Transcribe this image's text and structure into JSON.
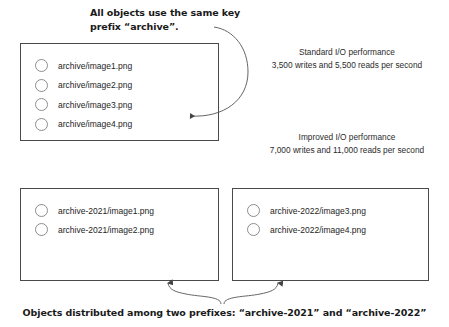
{
  "callouts": {
    "top": "All objects use the same key prefix “archive”.",
    "bottom": "Objects distributed among two prefixes: “archive-2021” and “archive-2022”"
  },
  "performance": {
    "standard": {
      "title": "Standard I/O performance",
      "detail": "3,500 writes and 5,500 reads per second"
    },
    "improved": {
      "title": "Improved I/O performance",
      "detail": "7,000 writes and 11,000 reads per second"
    }
  },
  "boxes": {
    "single_prefix": {
      "objects": [
        "archive/image1.png",
        "archive/image2.png",
        "archive/image3.png",
        "archive/image4.png"
      ]
    },
    "prefix_2021": {
      "objects": [
        "archive-2021/image1.png",
        "archive-2021/image2.png"
      ]
    },
    "prefix_2022": {
      "objects": [
        "archive-2022/image3.png",
        "archive-2022/image4.png"
      ]
    }
  },
  "colors": {
    "box_border": "#4a4a4a",
    "bullet_border": "#8d8d8d",
    "connector": "#555555",
    "caption_text": "#1a1a1a",
    "body_text": "#2b2b2b",
    "background": "#ffffff"
  }
}
